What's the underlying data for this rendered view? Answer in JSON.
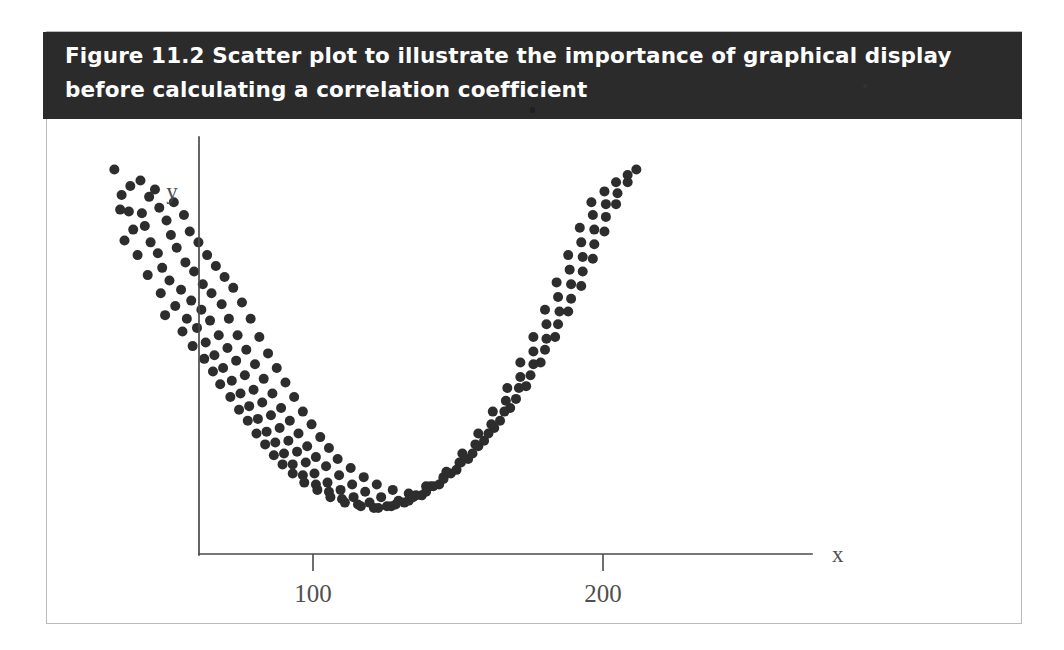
{
  "figure": {
    "caption": "Figure 11.2 Scatter plot to illustrate the importance of graphical display before calculating a correlation coefficient",
    "caption_background": "#2b2b2b",
    "caption_text_color": "#ffffff",
    "frame_border_color": "#b9bcbe",
    "background": "#ffffff"
  },
  "axes": {
    "x_label": "x",
    "y_label": "y",
    "x_ticks": [
      {
        "label": "100",
        "value": 100
      },
      {
        "label": "200",
        "value": 200
      }
    ],
    "y_ticks": [],
    "axis_color": "#4a4a4a",
    "grid": false
  },
  "chart_data": {
    "type": "scatter",
    "title": "Figure 11.2 Scatter plot to illustrate the importance of graphical display before calculating a correlation coefficient",
    "xlabel": "x",
    "ylabel": "y",
    "xlim": [
      25,
      235
    ],
    "ylim": [
      0,
      100
    ],
    "xticks": [
      100,
      200
    ],
    "xticklabels": [
      "100",
      "200"
    ],
    "yticks": [],
    "grid": false,
    "legend": null,
    "marker": {
      "shape": "circle",
      "color": "#2d2d2d",
      "size_px": 10
    },
    "annotation": "U-shaped (quadratic) relationship with zero linear correlation",
    "n_points": 170,
    "points": [
      [
        31.5,
        96.0
      ],
      [
        34.0,
        89.0
      ],
      [
        37.0,
        91.5
      ],
      [
        33.5,
        85.0
      ],
      [
        36.5,
        84.5
      ],
      [
        40.5,
        93.0
      ],
      [
        43.5,
        88.5
      ],
      [
        41.0,
        84.0
      ],
      [
        45.5,
        90.5
      ],
      [
        38.0,
        79.5
      ],
      [
        42.0,
        80.5
      ],
      [
        47.0,
        85.5
      ],
      [
        35.0,
        76.5
      ],
      [
        44.0,
        76.0
      ],
      [
        49.5,
        82.0
      ],
      [
        52.0,
        87.0
      ],
      [
        39.5,
        72.5
      ],
      [
        46.5,
        73.0
      ],
      [
        51.0,
        78.0
      ],
      [
        55.5,
        83.5
      ],
      [
        48.0,
        69.0
      ],
      [
        53.0,
        74.5
      ],
      [
        57.5,
        79.0
      ],
      [
        43.0,
        67.0
      ],
      [
        50.5,
        65.5
      ],
      [
        56.0,
        70.5
      ],
      [
        60.5,
        76.0
      ],
      [
        47.5,
        62.0
      ],
      [
        54.5,
        63.0
      ],
      [
        59.0,
        68.0
      ],
      [
        63.5,
        72.5
      ],
      [
        52.5,
        58.5
      ],
      [
        58.0,
        60.0
      ],
      [
        62.0,
        64.5
      ],
      [
        66.5,
        69.5
      ],
      [
        49.0,
        56.0
      ],
      [
        56.5,
        55.0
      ],
      [
        61.5,
        57.5
      ],
      [
        65.0,
        62.0
      ],
      [
        69.5,
        66.5
      ],
      [
        55.0,
        51.5
      ],
      [
        60.0,
        52.5
      ],
      [
        64.5,
        54.5
      ],
      [
        68.5,
        59.0
      ],
      [
        72.5,
        63.5
      ],
      [
        58.5,
        47.5
      ],
      [
        63.0,
        48.5
      ],
      [
        67.5,
        50.5
      ],
      [
        71.0,
        55.0
      ],
      [
        75.5,
        59.5
      ],
      [
        62.5,
        44.0
      ],
      [
        66.0,
        45.0
      ],
      [
        70.5,
        47.0
      ],
      [
        74.0,
        50.5
      ],
      [
        78.5,
        55.0
      ],
      [
        65.5,
        40.5
      ],
      [
        69.0,
        41.5
      ],
      [
        73.5,
        43.5
      ],
      [
        77.0,
        46.5
      ],
      [
        81.5,
        50.0
      ],
      [
        68.0,
        37.0
      ],
      [
        72.0,
        38.0
      ],
      [
        76.5,
        39.5
      ],
      [
        80.0,
        42.5
      ],
      [
        84.5,
        45.5
      ],
      [
        71.5,
        33.5
      ],
      [
        75.0,
        34.5
      ],
      [
        79.5,
        35.5
      ],
      [
        83.0,
        38.5
      ],
      [
        87.5,
        41.5
      ],
      [
        74.5,
        30.0
      ],
      [
        78.0,
        31.0
      ],
      [
        82.5,
        32.0
      ],
      [
        86.0,
        34.5
      ],
      [
        90.5,
        37.5
      ],
      [
        77.5,
        27.0
      ],
      [
        81.0,
        27.5
      ],
      [
        85.5,
        28.5
      ],
      [
        89.0,
        30.5
      ],
      [
        93.5,
        33.5
      ],
      [
        80.5,
        23.5
      ],
      [
        84.0,
        24.0
      ],
      [
        88.5,
        25.0
      ],
      [
        92.0,
        27.0
      ],
      [
        96.5,
        29.5
      ],
      [
        83.5,
        20.5
      ],
      [
        87.0,
        21.0
      ],
      [
        91.5,
        21.5
      ],
      [
        95.0,
        23.5
      ],
      [
        99.5,
        26.0
      ],
      [
        86.5,
        17.5
      ],
      [
        90.0,
        18.0
      ],
      [
        94.5,
        18.5
      ],
      [
        98.0,
        20.0
      ],
      [
        102.5,
        22.5
      ],
      [
        89.5,
        15.0
      ],
      [
        93.0,
        15.0
      ],
      [
        97.5,
        15.5
      ],
      [
        101.0,
        17.0
      ],
      [
        105.5,
        19.5
      ],
      [
        93.0,
        12.5
      ],
      [
        96.5,
        12.0
      ],
      [
        100.5,
        12.5
      ],
      [
        104.5,
        14.5
      ],
      [
        108.5,
        16.5
      ],
      [
        97.0,
        10.0
      ],
      [
        101.0,
        9.5
      ],
      [
        105.0,
        10.0
      ],
      [
        109.0,
        12.0
      ],
      [
        113.0,
        14.0
      ],
      [
        101.5,
        8.0
      ],
      [
        105.5,
        7.5
      ],
      [
        109.5,
        8.0
      ],
      [
        113.5,
        9.5
      ],
      [
        117.5,
        11.5
      ],
      [
        106.0,
        6.0
      ],
      [
        110.0,
        5.5
      ],
      [
        114.0,
        6.0
      ],
      [
        118.0,
        7.5
      ],
      [
        122.0,
        9.5
      ],
      [
        111.0,
        4.5
      ],
      [
        115.5,
        4.0
      ],
      [
        119.5,
        4.5
      ],
      [
        123.5,
        6.0
      ],
      [
        127.5,
        8.0
      ],
      [
        116.5,
        3.5
      ],
      [
        121.0,
        3.0
      ],
      [
        125.5,
        3.5
      ],
      [
        129.5,
        5.0
      ],
      [
        133.0,
        7.0
      ],
      [
        122.5,
        3.0
      ],
      [
        127.0,
        3.5
      ],
      [
        131.5,
        4.5
      ],
      [
        135.5,
        6.5
      ],
      [
        139.0,
        9.0
      ],
      [
        128.5,
        4.0
      ],
      [
        133.0,
        5.0
      ],
      [
        137.5,
        6.5
      ],
      [
        141.5,
        9.0
      ],
      [
        145.0,
        11.5
      ],
      [
        134.5,
        6.0
      ],
      [
        139.0,
        7.5
      ],
      [
        143.5,
        9.5
      ],
      [
        147.5,
        12.5
      ],
      [
        151.0,
        15.5
      ],
      [
        140.5,
        9.0
      ],
      [
        145.0,
        11.0
      ],
      [
        149.5,
        13.5
      ],
      [
        153.5,
        16.5
      ],
      [
        157.0,
        20.0
      ],
      [
        146.0,
        13.0
      ],
      [
        150.5,
        15.5
      ],
      [
        155.0,
        18.0
      ],
      [
        159.0,
        21.5
      ],
      [
        162.5,
        25.0
      ],
      [
        151.5,
        18.0
      ],
      [
        156.0,
        20.5
      ],
      [
        160.5,
        23.5
      ],
      [
        164.5,
        27.0
      ],
      [
        168.0,
        30.5
      ],
      [
        157.0,
        23.5
      ],
      [
        161.5,
        26.0
      ],
      [
        166.0,
        29.5
      ],
      [
        170.0,
        33.0
      ],
      [
        173.5,
        36.5
      ],
      [
        162.0,
        29.5
      ],
      [
        166.5,
        32.5
      ],
      [
        171.0,
        36.0
      ],
      [
        175.0,
        39.5
      ],
      [
        178.5,
        43.0
      ],
      [
        167.0,
        36.0
      ],
      [
        171.5,
        39.0
      ],
      [
        176.0,
        42.5
      ],
      [
        180.0,
        46.5
      ],
      [
        183.5,
        50.0
      ],
      [
        171.5,
        43.0
      ],
      [
        176.0,
        46.0
      ],
      [
        180.5,
        49.5
      ],
      [
        184.5,
        53.5
      ],
      [
        188.0,
        57.0
      ],
      [
        176.0,
        50.0
      ],
      [
        180.5,
        53.5
      ],
      [
        185.0,
        57.0
      ],
      [
        189.0,
        60.5
      ],
      [
        192.5,
        64.0
      ],
      [
        180.0,
        57.5
      ],
      [
        184.5,
        61.0
      ],
      [
        189.0,
        64.5
      ],
      [
        193.0,
        68.0
      ],
      [
        196.5,
        71.5
      ],
      [
        184.0,
        65.0
      ],
      [
        188.5,
        68.5
      ],
      [
        193.0,
        72.0
      ],
      [
        197.0,
        75.5
      ],
      [
        200.5,
        79.0
      ],
      [
        188.0,
        72.5
      ],
      [
        192.5,
        76.0
      ],
      [
        197.0,
        79.5
      ],
      [
        201.0,
        83.0
      ],
      [
        204.5,
        86.5
      ],
      [
        192.0,
        80.0
      ],
      [
        196.5,
        83.5
      ],
      [
        201.0,
        86.5
      ],
      [
        205.0,
        89.5
      ],
      [
        208.5,
        92.5
      ],
      [
        196.0,
        87.0
      ],
      [
        200.5,
        90.0
      ],
      [
        204.5,
        92.5
      ],
      [
        208.5,
        94.5
      ],
      [
        211.5,
        96.0
      ]
    ]
  }
}
